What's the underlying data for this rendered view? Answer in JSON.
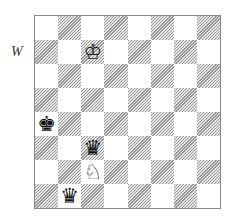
{
  "side_to_move_label": "W",
  "board": {
    "files": [
      "a",
      "b",
      "c",
      "d",
      "e",
      "f",
      "g",
      "h"
    ],
    "ranks": [
      8,
      7,
      6,
      5,
      4,
      3,
      2,
      1
    ],
    "colors": {
      "light": "#ffffff",
      "dark": "#9a9a9a"
    },
    "pieces": [
      {
        "square": "c7",
        "piece": "king",
        "color": "white",
        "glyph": "♔"
      },
      {
        "square": "a4",
        "piece": "king",
        "color": "black",
        "glyph": "♚"
      },
      {
        "square": "c3",
        "piece": "queen",
        "color": "black",
        "glyph": "♛"
      },
      {
        "square": "c2",
        "piece": "knight",
        "color": "white",
        "glyph": "♘"
      },
      {
        "square": "b1",
        "piece": "queen",
        "color": "black",
        "glyph": "♛"
      }
    ]
  }
}
